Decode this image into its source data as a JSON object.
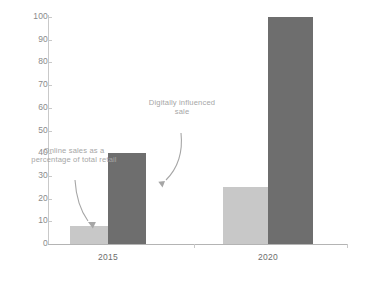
{
  "chart_data": {
    "type": "bar",
    "title": "",
    "subtitle": "",
    "xlabel": "",
    "ylabel": "",
    "categories": [
      "2015",
      "2020"
    ],
    "series": [
      {
        "name": "Online sales as a percentage of total retail",
        "color": "#c8c8c8",
        "values": [
          8,
          25
        ]
      },
      {
        "name": "Digitally influenced sale",
        "color": "#6e6e6e",
        "values": [
          40,
          100
        ]
      }
    ],
    "ylim": [
      0,
      100
    ],
    "yticks": [
      0,
      10,
      20,
      30,
      40,
      50,
      60,
      70,
      80,
      90,
      100
    ],
    "ytick_labels": [
      "0",
      "10",
      "20",
      "30",
      "40",
      "50",
      "60",
      "70",
      "80",
      "90",
      "100"
    ],
    "grid": false,
    "legend": "none",
    "annotations": [
      {
        "id": "online-sales",
        "text": "Online sales as a percentage of total retail",
        "target": "2015 light bar",
        "arrow": "straight-down"
      },
      {
        "id": "digitally-influenced",
        "text": "Digitally influenced sale",
        "target": "2020 light bar",
        "arrow": "curved-down-left"
      }
    ]
  },
  "colors": {
    "light_bar": "#c8c8c8",
    "dark_bar": "#6e6e6e",
    "axis": "#c9c9c9",
    "annotation_text": "#a6a6a6",
    "tick_text": "#8a8a8a",
    "background": "#ffffff"
  }
}
